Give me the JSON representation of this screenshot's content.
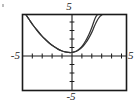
{
  "figure": {
    "kind": "graphing-calculator-window",
    "background_color": "#ffffff",
    "frame_color": "#1a1a1a",
    "axis_color": "#1a1a1a",
    "curve_color": "#333333"
  },
  "labels": {
    "top": "5",
    "bottom": "-5",
    "left": "-5",
    "right": "5"
  },
  "chart_data": {
    "type": "line",
    "title": "",
    "xlabel": "",
    "ylabel": "",
    "xlim": [
      -5,
      5
    ],
    "ylim": [
      -5,
      5
    ],
    "grid": false,
    "legend": "none",
    "xticks": [
      -5,
      -4,
      -3,
      -2,
      -1,
      0,
      1,
      2,
      3,
      4,
      5
    ],
    "yticks": [
      -5,
      -4,
      -3,
      -2,
      -1,
      0,
      1,
      2,
      3,
      4,
      5
    ],
    "xtick_labels": [
      "-5",
      "",
      "",
      "",
      "",
      "",
      "",
      "",
      "",
      "",
      "5"
    ],
    "ytick_labels": [
      "-5",
      "",
      "",
      "",
      "",
      "",
      "",
      "",
      "",
      "",
      "5"
    ],
    "annotations": [
      "two nearly coincident upward-opening curves",
      "vertex resting on the x-axis just left of the y-axis",
      "curves separate slightly in the upper right"
    ],
    "series": [
      {
        "name": "curve-1",
        "x": [
          -4.7,
          -4.4,
          -4.0,
          -3.6,
          -3.2,
          -2.8,
          -2.4,
          -2.0,
          -1.6,
          -1.2,
          -0.9,
          -0.6,
          -0.35,
          -0.1,
          0.2,
          0.5,
          0.8,
          1.1,
          1.4,
          1.7,
          1.9,
          2.05,
          2.2
        ],
        "y": [
          5.0,
          4.4,
          3.6,
          2.9,
          2.25,
          1.7,
          1.2,
          0.8,
          0.45,
          0.2,
          0.08,
          0.02,
          0.0,
          0.05,
          0.2,
          0.5,
          0.95,
          1.6,
          2.4,
          3.4,
          4.2,
          4.7,
          5.0
        ]
      },
      {
        "name": "curve-2",
        "x": [
          -4.7,
          -4.4,
          -4.0,
          -3.6,
          -3.2,
          -2.8,
          -2.4,
          -2.0,
          -1.6,
          -1.2,
          -0.9,
          -0.6,
          -0.35,
          -0.1,
          0.2,
          0.5,
          0.8,
          1.1,
          1.4,
          1.7,
          1.9,
          2.1,
          2.3,
          2.5,
          2.65
        ],
        "y": [
          5.0,
          4.4,
          3.6,
          2.9,
          2.25,
          1.7,
          1.2,
          0.8,
          0.45,
          0.2,
          0.08,
          0.02,
          0.0,
          0.04,
          0.17,
          0.42,
          0.8,
          1.3,
          1.95,
          2.75,
          3.4,
          4.0,
          4.5,
          4.85,
          5.0
        ]
      }
    ]
  }
}
